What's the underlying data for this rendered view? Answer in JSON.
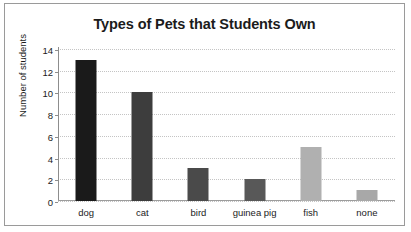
{
  "chart_data": {
    "type": "bar",
    "title": "Types of Pets that Students Own",
    "xlabel": "",
    "ylabel": "Number of students",
    "categories": [
      "dog",
      "cat",
      "bird",
      "guinea pig",
      "fish",
      "none"
    ],
    "values": [
      13,
      10,
      3,
      2,
      5,
      1
    ],
    "ylim": [
      0,
      14
    ],
    "ytick_step": 2,
    "yticks": [
      "14",
      "12",
      "10",
      "8",
      "6",
      "4",
      "2",
      "0"
    ],
    "ytick_values": [
      14,
      12,
      10,
      8,
      6,
      4,
      2,
      0
    ],
    "grid": true,
    "grid_style": "dotted",
    "grid_color": "#c4c4c4",
    "legend": false,
    "bar_colors": [
      "#1a1a1a",
      "#3d3d3d",
      "#4a4a4a",
      "#585858",
      "#b0b0b0",
      "#a8a8a8"
    ],
    "axis_color": "#8d8d8d",
    "frame_color": "#9a9a9a",
    "text_color": "#1b1b1b"
  }
}
